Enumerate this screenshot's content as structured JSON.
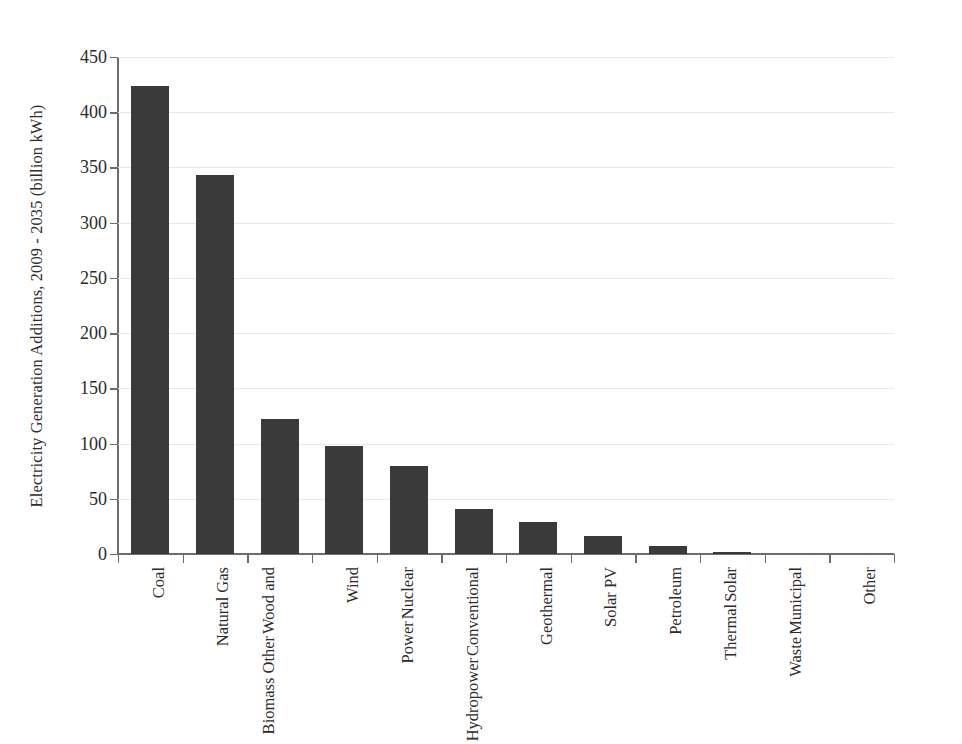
{
  "chart_data": {
    "type": "bar",
    "title": "",
    "xlabel": "",
    "ylabel": "Electricity Generation Additions, 2009 - 2035 (billion kWh)",
    "ylim": [
      0,
      450
    ],
    "ytick_labels": [
      "450",
      "400",
      "350",
      "300",
      "250",
      "200",
      "150",
      "100",
      "50",
      "0"
    ],
    "ytick_values": [
      450,
      400,
      350,
      300,
      250,
      200,
      150,
      100,
      50,
      0
    ],
    "ytick_step": 50,
    "grid": true,
    "grid_axis": "y",
    "legend": "none",
    "bar_color": "#3a3a3a",
    "axis_color": "#6d6d6d",
    "gridline_color": "#e8e8e8",
    "categories": [
      "Coal",
      "Natural Gas",
      "Wood and Other Biomass",
      "Wind",
      "Nuclear Power",
      "Conventional Hydropower",
      "Geothermal",
      "Solar PV",
      "Petroleum",
      "Solar Thermal",
      "Municipal Waste",
      "Other"
    ],
    "category_label_lines": [
      [
        "Coal"
      ],
      [
        "Natural Gas"
      ],
      [
        "Wood and",
        "Other",
        "Biomass"
      ],
      [
        "Wind"
      ],
      [
        "Nuclear",
        "Power"
      ],
      [
        "Conventional",
        "Hydropower"
      ],
      [
        "Geothermal"
      ],
      [
        "Solar PV"
      ],
      [
        "Petroleum"
      ],
      [
        "Solar",
        "Thermal"
      ],
      [
        "Municipal",
        "Waste"
      ],
      [
        "Other"
      ]
    ],
    "values": [
      424,
      343,
      122,
      98,
      80,
      41,
      29,
      16,
      7,
      2,
      0,
      0
    ]
  },
  "caption": {
    "text": ""
  }
}
